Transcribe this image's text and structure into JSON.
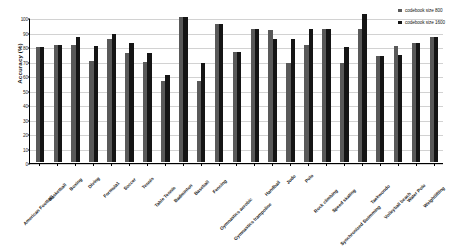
{
  "chart_data": {
    "type": "bar",
    "title": "",
    "xlabel": "",
    "ylabel": "Accuracy (%)",
    "ylim": [
      0,
      100
    ],
    "yticks": [
      0,
      10,
      20,
      30,
      40,
      50,
      60,
      70,
      80,
      90,
      100
    ],
    "grid": true,
    "legend_position": "top-right",
    "categories": [
      "American Football",
      "Basketball",
      "Boxing",
      "Diving",
      "Formula1",
      "Soccer",
      "Tennis",
      "Table Tennis",
      "Badminton",
      "Baseball",
      "Fencing",
      "Gymnastics aerobic",
      "Gymnastics trampoline",
      "Handball",
      "Judo",
      "Polo",
      "Rock climbing",
      "Speed skating",
      "Synchronized Swimming",
      "Taekwondo",
      "Volleyball beach",
      "Water Polo",
      "Weightlifting"
    ],
    "series": [
      {
        "name": "codebook size 800",
        "color": "#595959",
        "values": [
          79,
          81,
          81,
          70,
          85,
          75,
          69,
          56,
          100,
          56,
          95,
          76,
          92,
          91,
          68,
          81,
          92,
          68,
          92,
          73,
          80,
          82,
          86
        ]
      },
      {
        "name": "codebook size 1600",
        "color": "#151515",
        "values": [
          79,
          81,
          86,
          80,
          88,
          82,
          75,
          60,
          100,
          68,
          95,
          76,
          92,
          85,
          85,
          92,
          92,
          79,
          102,
          73,
          74,
          82,
          86
        ]
      }
    ]
  },
  "legend": {
    "items": [
      {
        "label": "codebook size 800",
        "series_index": 0
      },
      {
        "label": "codebook size 1600",
        "series_index": 1
      }
    ]
  },
  "axis": {
    "y_title": "Accuracy (%)"
  }
}
